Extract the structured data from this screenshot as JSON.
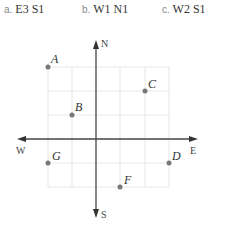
{
  "options": [
    {
      "letter": "a.",
      "text": "E3 S1"
    },
    {
      "letter": "b.",
      "text": "W1 N1"
    },
    {
      "letter": "c.",
      "text": "W2 S1"
    }
  ],
  "compass": {
    "north": "N",
    "south": "S",
    "east": "E",
    "west": "W"
  },
  "points": [
    {
      "label": "A",
      "x": -2,
      "y": 3
    },
    {
      "label": "B",
      "x": -1,
      "y": 1
    },
    {
      "label": "C",
      "x": 2,
      "y": 2
    },
    {
      "label": "D",
      "x": 3,
      "y": -1
    },
    {
      "label": "F",
      "x": 1,
      "y": -2
    },
    {
      "label": "G",
      "x": -2,
      "y": -1
    }
  ],
  "colors": {
    "grid": "#e6e6e6",
    "axis": "#444444",
    "point": "#777777"
  }
}
